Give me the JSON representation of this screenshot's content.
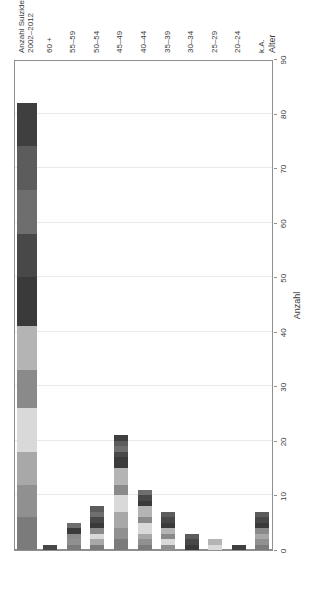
{
  "chart_data": {
    "type": "bar",
    "orientation": "horizontal-stacked",
    "title": "",
    "xlabel": "Alter",
    "ylabel": "Anzahl",
    "ylim": [
      0,
      90
    ],
    "yticks": [
      0,
      10,
      20,
      30,
      40,
      50,
      60,
      70,
      80,
      90
    ],
    "grid": true,
    "legend_position": "top-left",
    "categories": [
      "k.A.",
      "20–24",
      "25–29",
      "30–34",
      "35–39",
      "40–44",
      "45–49",
      "50–54",
      "55–59",
      "60 +",
      "Anzahl Suizide 2002–2012"
    ],
    "category_totals": [
      7,
      1,
      2,
      3,
      7,
      11,
      21,
      8,
      5,
      1,
      82
    ],
    "series": [
      {
        "name": "2002",
        "color": "#7b7b7b",
        "values": [
          1,
          0,
          0,
          0,
          0,
          1,
          2,
          1,
          1,
          0,
          6
        ]
      },
      {
        "name": "2003",
        "color": "#909090",
        "values": [
          1,
          0,
          0,
          0,
          1,
          1,
          2,
          0,
          1,
          0,
          6
        ]
      },
      {
        "name": "2004",
        "color": "#a8a8a8",
        "values": [
          1,
          0,
          0,
          0,
          0,
          1,
          3,
          1,
          0,
          0,
          6
        ]
      },
      {
        "name": "2005",
        "color": "#d9d9d9",
        "values": [
          0,
          0,
          1,
          0,
          1,
          2,
          3,
          1,
          0,
          0,
          8
        ]
      },
      {
        "name": "2006",
        "color": "#8a8a8a",
        "values": [
          1,
          0,
          0,
          0,
          1,
          1,
          2,
          1,
          1,
          0,
          7
        ]
      },
      {
        "name": "2007",
        "color": "#b4b4b4",
        "values": [
          0,
          0,
          1,
          0,
          1,
          2,
          3,
          0,
          0,
          0,
          8
        ]
      },
      {
        "name": "2008",
        "color": "#3a3a3a",
        "values": [
          1,
          0,
          0,
          1,
          1,
          1,
          2,
          1,
          1,
          0,
          9
        ]
      },
      {
        "name": "2009",
        "color": "#484848",
        "values": [
          1,
          0,
          0,
          1,
          1,
          1,
          1,
          1,
          0,
          1,
          8
        ]
      },
      {
        "name": "2010",
        "color": "#6e6e6e",
        "values": [
          0,
          0,
          0,
          0,
          0,
          1,
          1,
          1,
          1,
          0,
          8
        ]
      },
      {
        "name": "2011",
        "color": "#5c5c5c",
        "values": [
          1,
          0,
          0,
          1,
          1,
          0,
          1,
          1,
          0,
          0,
          8
        ]
      },
      {
        "name": "2012",
        "color": "#3f3f3f",
        "values": [
          0,
          1,
          0,
          0,
          0,
          0,
          1,
          0,
          0,
          0,
          8
        ]
      }
    ]
  },
  "axes": {
    "y_title": "Anzahl",
    "x_title": "Alter",
    "y_tick_labels": [
      "0",
      "10",
      "20",
      "30",
      "40",
      "50",
      "60",
      "70",
      "80",
      "90"
    ]
  },
  "legend": {
    "entries": [
      {
        "label": "2002",
        "color": "#7b7b7b"
      },
      {
        "label": "2003",
        "color": "#909090"
      },
      {
        "label": "2004",
        "color": "#a8a8a8"
      },
      {
        "label": "2005",
        "color": "#d9d9d9"
      },
      {
        "label": "2006",
        "color": "#8a8a8a"
      },
      {
        "label": "2007",
        "color": "#b4b4b4"
      },
      {
        "label": "2008",
        "color": "#3a3a3a"
      },
      {
        "label": "2009",
        "color": "#484848"
      },
      {
        "label": "2010",
        "color": "#6e6e6e"
      },
      {
        "label": "2011",
        "color": "#5c5c5c"
      },
      {
        "label": "2012",
        "color": "#3f3f3f"
      }
    ]
  },
  "category_label_lines": [
    [
      "k.A."
    ],
    [
      "20–24"
    ],
    [
      "25–29"
    ],
    [
      "30–34"
    ],
    [
      "35–39"
    ],
    [
      "40–44"
    ],
    [
      "45–49"
    ],
    [
      "50–54"
    ],
    [
      "55–59"
    ],
    [
      "60 +"
    ],
    [
      "Anzahl Suizide",
      "2002–2012"
    ]
  ]
}
